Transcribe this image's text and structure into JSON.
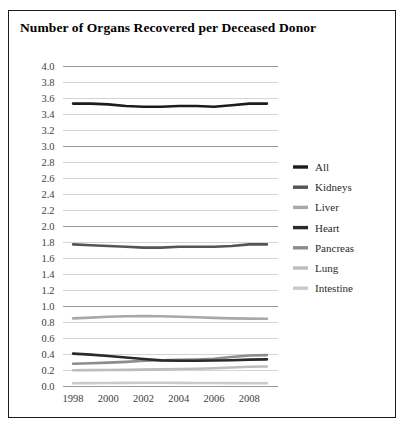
{
  "figure": {
    "title": "Number of Organs Recovered per Deceased Donor",
    "border_color": "#1a1a1a",
    "background": "#ffffff"
  },
  "chart_data": {
    "type": "line",
    "title": "Number of Organs Recovered per Deceased Donor",
    "xlabel": "",
    "ylabel": "",
    "xlim": [
      1997.4,
      2009.6
    ],
    "ylim": [
      0.0,
      4.0
    ],
    "grid": true,
    "grid_axis": "y",
    "legend_position": "right",
    "x": [
      1998,
      1999,
      2000,
      2001,
      2002,
      2003,
      2004,
      2005,
      2006,
      2007,
      2008,
      2009
    ],
    "xticks": [
      1998,
      2000,
      2002,
      2004,
      2006,
      2008
    ],
    "xtick_labels": [
      "1998",
      "2000",
      "2002",
      "2004",
      "2006",
      "2008"
    ],
    "yticks": [
      0.0,
      0.2,
      0.4,
      0.6,
      0.8,
      1.0,
      1.2,
      1.4,
      1.6,
      1.8,
      2.0,
      2.2,
      2.4,
      2.6,
      2.8,
      3.0,
      3.2,
      3.4,
      3.6,
      3.8,
      4.0
    ],
    "ytick_labels": [
      "0.0",
      "0.2",
      "0.4",
      "0.6",
      "0.8",
      "1.0",
      "1.2",
      "1.4",
      "1.6",
      "1.8",
      "2.0",
      "2.2",
      "2.4",
      "2.6",
      "2.8",
      "3.0",
      "3.2",
      "3.4",
      "3.6",
      "3.8",
      "4.0"
    ],
    "series": [
      {
        "name": "All",
        "color": "#1c1c1c",
        "width": 2.6,
        "values": [
          3.53,
          3.53,
          3.52,
          3.5,
          3.49,
          3.49,
          3.5,
          3.5,
          3.49,
          3.51,
          3.53,
          3.53
        ]
      },
      {
        "name": "Kidneys",
        "color": "#555555",
        "width": 2.6,
        "values": [
          1.77,
          1.76,
          1.75,
          1.74,
          1.73,
          1.73,
          1.74,
          1.74,
          1.74,
          1.75,
          1.77,
          1.77
        ]
      },
      {
        "name": "Liver",
        "color": "#a8a8a8",
        "width": 2.6,
        "values": [
          0.845,
          0.855,
          0.865,
          0.872,
          0.874,
          0.872,
          0.866,
          0.86,
          0.852,
          0.845,
          0.842,
          0.84
        ]
      },
      {
        "name": "Heart",
        "color": "#2a2a2a",
        "width": 2.6,
        "values": [
          0.405,
          0.392,
          0.375,
          0.357,
          0.337,
          0.32,
          0.315,
          0.316,
          0.318,
          0.322,
          0.33,
          0.333
        ]
      },
      {
        "name": "Pancreas",
        "color": "#8c8c8c",
        "width": 2.6,
        "values": [
          0.278,
          0.284,
          0.292,
          0.302,
          0.315,
          0.322,
          0.326,
          0.332,
          0.34,
          0.362,
          0.382,
          0.386
        ]
      },
      {
        "name": "Lung",
        "color": "#bdbdbd",
        "width": 2.6,
        "values": [
          0.196,
          0.198,
          0.2,
          0.202,
          0.205,
          0.208,
          0.212,
          0.216,
          0.222,
          0.232,
          0.24,
          0.243
        ]
      },
      {
        "name": "Intestine",
        "color": "#cacaca",
        "width": 2.6,
        "values": [
          0.034,
          0.036,
          0.038,
          0.039,
          0.04,
          0.04,
          0.039,
          0.038,
          0.037,
          0.036,
          0.035,
          0.034
        ]
      }
    ]
  },
  "legend": {
    "items": [
      {
        "label": "All",
        "color": "#1c1c1c"
      },
      {
        "label": "Kidneys",
        "color": "#555555"
      },
      {
        "label": "Liver",
        "color": "#a8a8a8"
      },
      {
        "label": "Heart",
        "color": "#2a2a2a"
      },
      {
        "label": "Pancreas",
        "color": "#8c8c8c"
      },
      {
        "label": "Lung",
        "color": "#bdbdbd"
      },
      {
        "label": "Intestine",
        "color": "#cacaca"
      }
    ]
  },
  "style": {
    "gridline_minor_color": "#d4d4d4",
    "gridline_major_color": "#9a9a9a",
    "tick_label_color": "#3d3d3d"
  }
}
